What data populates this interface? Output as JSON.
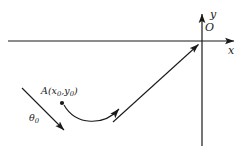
{
  "figure": {
    "background_color": "#ffffff",
    "stroke_color": "#1a1a1a",
    "width": 243,
    "height": 146
  },
  "axes": {
    "y_label": "y",
    "x_label": "x",
    "origin_label": "O",
    "origin_px": {
      "x": 202,
      "y": 41
    },
    "x_axis": {
      "start_x": 8,
      "end_x": 238,
      "y": 41,
      "arrow": "right"
    },
    "y_axis": {
      "x": 202,
      "start_y": 146,
      "end_y": 10,
      "arrow": "up"
    }
  },
  "points": {
    "a": {
      "label_name": "A",
      "label_coords": "(x0,y0)",
      "x_symbol": "x",
      "x_subscript": "0",
      "y_symbol": "y",
      "y_subscript": "0",
      "open_paren": "(",
      "comma": ",",
      "close_paren": ")",
      "marker_px": {
        "x": 62,
        "y": 103
      }
    }
  },
  "angle": {
    "symbol": "θ",
    "subscript": "0",
    "label": "θ0",
    "arrow_from": {
      "x": 22,
      "y": 88
    },
    "arrow_to": {
      "x": 67,
      "y": 133
    }
  },
  "curves": {
    "trajectory": {
      "name": "trajectory-curve",
      "description": "curved arc from point A dipping down then rising to the right with arrowhead",
      "start": {
        "x": 64,
        "y": 105
      },
      "control_1": {
        "x": 76,
        "y": 126
      },
      "control_2": {
        "x": 104,
        "y": 126
      },
      "end": {
        "x": 122,
        "y": 107
      },
      "arrow": "end"
    },
    "ray_to_origin": {
      "name": "straight-ray-to-origin",
      "description": "straight line from lower left up to the origin with arrowhead at origin",
      "start": {
        "x": 113,
        "y": 122
      },
      "end": {
        "x": 201,
        "y": 42
      },
      "arrow": "end"
    }
  }
}
